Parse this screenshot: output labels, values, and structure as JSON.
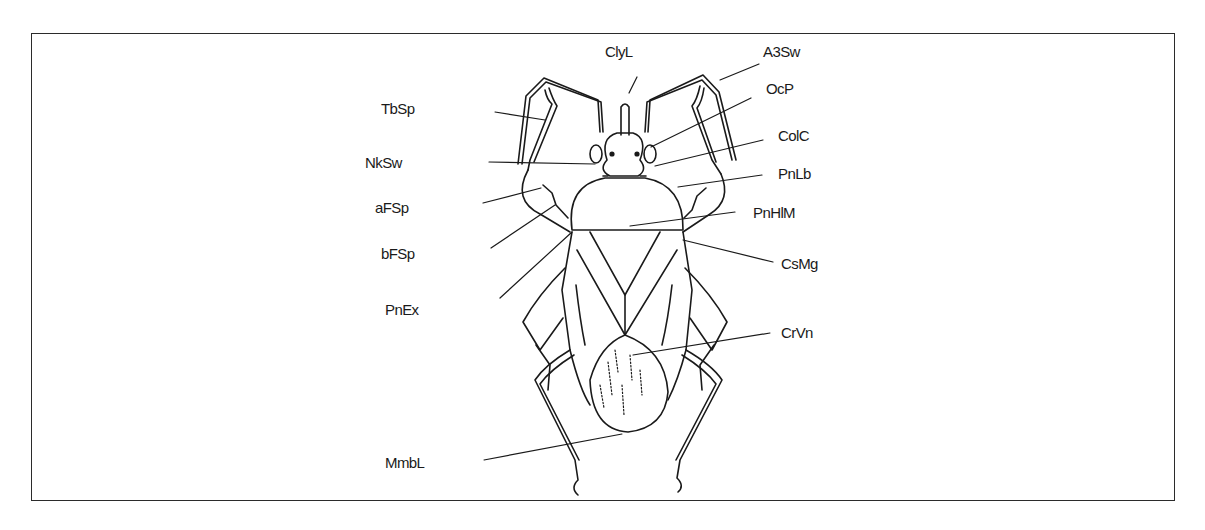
{
  "figure": {
    "type": "labeled anatomical line drawing",
    "colors": {
      "line": "#1a1a1a",
      "frame": "#2b2b2b",
      "background": "#ffffff"
    }
  },
  "labels": {
    "clyl": {
      "text": "ClyL",
      "side": "top"
    },
    "a3sw": {
      "text": "A3Sw",
      "side": "right"
    },
    "tbsp": {
      "text": "TbSp",
      "side": "left"
    },
    "ocp": {
      "text": "OcP",
      "side": "right"
    },
    "nksw": {
      "text": "NkSw",
      "side": "left"
    },
    "colc": {
      "text": "ColC",
      "side": "right"
    },
    "afsp": {
      "text": "aFSp",
      "side": "left"
    },
    "pnlb": {
      "text": "PnLb",
      "side": "right"
    },
    "bfsp": {
      "text": "bFSp",
      "side": "left"
    },
    "pnhlm": {
      "text": "PnHlM",
      "side": "right"
    },
    "csmg": {
      "text": "CsMg",
      "side": "right"
    },
    "pnex": {
      "text": "PnEx",
      "side": "left"
    },
    "crvn": {
      "text": "CrVn",
      "side": "right"
    },
    "mmbl": {
      "text": "MmbL",
      "side": "left"
    }
  }
}
